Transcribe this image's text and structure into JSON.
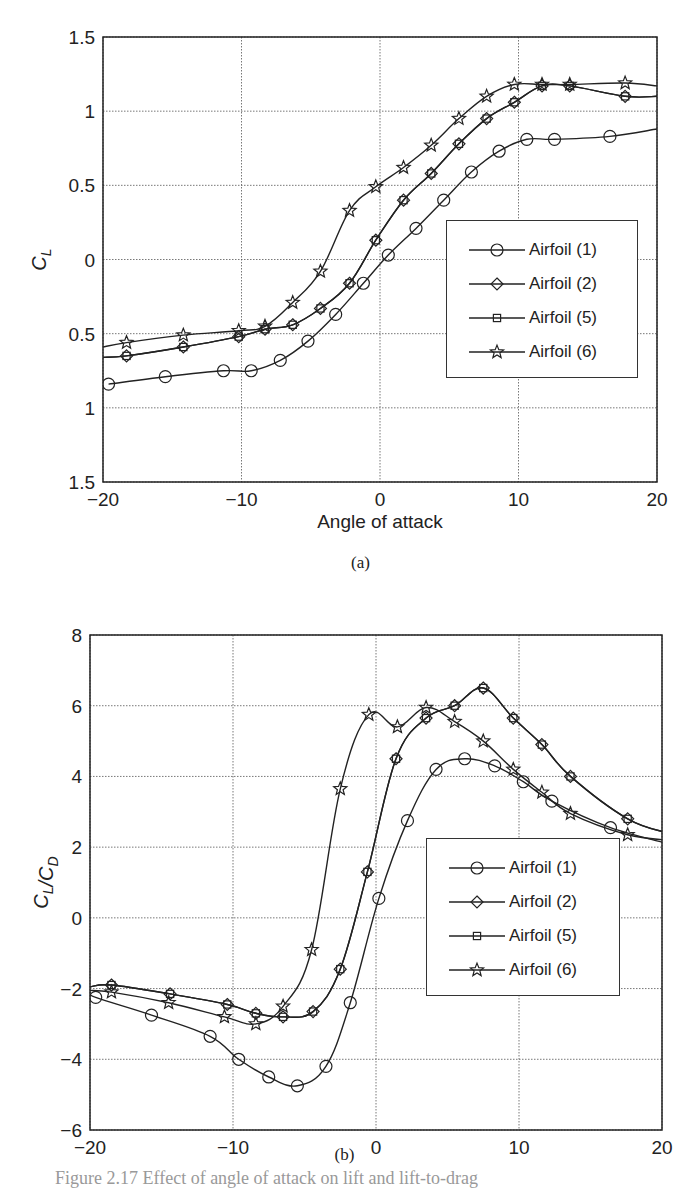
{
  "figure": {
    "panel_a_caption": "(a)",
    "panel_b_caption": "(b)",
    "figure_caption_partial": "Figure 2.17  Effect of angle of attack on lift and lift-to-drag"
  },
  "chart_data": [
    {
      "id": "a",
      "type": "line",
      "title": "",
      "xlabel": "Angle of attack",
      "ylabel": "C_L",
      "xlim": [
        -20,
        20
      ],
      "ylim": [
        -1.5,
        1.5
      ],
      "xticks": [
        "-20",
        "-10",
        "0",
        "10",
        "20"
      ],
      "yticks": [
        "1.5",
        "1",
        "0.5",
        "0",
        "0.5",
        "1",
        "1.5"
      ],
      "ytick_values": [
        1.5,
        1,
        0.5,
        0,
        -0.5,
        -1,
        -1.5
      ],
      "grid": true,
      "legend_position": "center-right",
      "series": [
        {
          "name": "Airfoil (1)",
          "marker": "circle",
          "x": [
            -19.6,
            -15.5,
            -11.3,
            -9.3,
            -7.2,
            -5.2,
            -3.2,
            -1.2,
            0.6,
            2.6,
            4.6,
            6.6,
            8.6,
            10.6,
            12.6,
            16.6,
            20
          ],
          "y": [
            -0.84,
            -0.79,
            -0.75,
            -0.75,
            -0.68,
            -0.55,
            -0.37,
            -0.16,
            0.03,
            0.21,
            0.4,
            0.59,
            0.73,
            0.81,
            0.81,
            0.83,
            0.88
          ]
        },
        {
          "name": "Airfoil (2)",
          "marker": "diamond",
          "x": [
            -20,
            -18.3,
            -14.2,
            -10.2,
            -8.3,
            -6.3,
            -4.3,
            -2.2,
            -0.3,
            1.7,
            3.7,
            5.7,
            7.7,
            9.7,
            11.7,
            13.7,
            17.7,
            20
          ],
          "y": [
            -0.66,
            -0.65,
            -0.59,
            -0.52,
            -0.47,
            -0.44,
            -0.33,
            -0.16,
            0.13,
            0.4,
            0.58,
            0.78,
            0.95,
            1.06,
            1.17,
            1.17,
            1.1,
            1.1
          ]
        },
        {
          "name": "Airfoil (5)",
          "marker": "square",
          "x": [
            -20,
            -18.3,
            -14.2,
            -10.2,
            -8.3,
            -6.3,
            -4.3,
            -2.2,
            -0.3,
            1.7,
            3.7,
            5.7,
            7.7,
            9.7,
            11.7,
            13.7,
            17.7,
            20
          ],
          "y": [
            -0.66,
            -0.65,
            -0.59,
            -0.52,
            -0.47,
            -0.44,
            -0.33,
            -0.16,
            0.13,
            0.4,
            0.58,
            0.78,
            0.95,
            1.06,
            1.17,
            1.17,
            1.1,
            1.1
          ]
        },
        {
          "name": "Airfoil (6)",
          "marker": "star",
          "x": [
            -20,
            -18.3,
            -14.2,
            -10.2,
            -8.3,
            -6.3,
            -4.3,
            -2.2,
            -0.3,
            1.7,
            3.7,
            5.7,
            7.7,
            9.7,
            11.7,
            13.7,
            17.7,
            20
          ],
          "y": [
            -0.59,
            -0.56,
            -0.51,
            -0.48,
            -0.45,
            -0.29,
            -0.08,
            0.33,
            0.49,
            0.62,
            0.77,
            0.95,
            1.1,
            1.18,
            1.18,
            1.18,
            1.19,
            1.17
          ]
        }
      ]
    },
    {
      "id": "b",
      "type": "line",
      "title": "",
      "xlabel": "Angle of attack",
      "ylabel": "C_L/C_D",
      "xlim": [
        -20,
        20
      ],
      "ylim": [
        -6,
        8
      ],
      "xticks": [
        "-20",
        "-10",
        "0",
        "10",
        "20"
      ],
      "yticks": [
        "8",
        "6",
        "4",
        "2",
        "0",
        "-2",
        "-4",
        "-6"
      ],
      "ytick_values": [
        8,
        6,
        4,
        2,
        0,
        -2,
        -4,
        -6
      ],
      "grid": true,
      "legend_position": "lower-right",
      "series": [
        {
          "name": "Airfoil (1)",
          "marker": "circle",
          "x": [
            -20,
            -19.6,
            -15.7,
            -11.6,
            -9.6,
            -7.5,
            -5.5,
            -3.5,
            -1.8,
            0.2,
            2.2,
            4.2,
            6.2,
            8.3,
            10.3,
            12.3,
            16.4,
            20.4
          ],
          "y": [
            -2.1,
            -2.25,
            -2.75,
            -3.35,
            -4.0,
            -4.5,
            -4.75,
            -4.2,
            -2.4,
            0.55,
            2.75,
            4.2,
            4.5,
            4.3,
            3.85,
            3.3,
            2.55,
            2.1
          ]
        },
        {
          "name": "Airfoil (2)",
          "marker": "diamond",
          "x": [
            -20,
            -18.5,
            -14.4,
            -10.4,
            -8.4,
            -6.5,
            -4.4,
            -2.5,
            -0.6,
            1.4,
            3.5,
            5.5,
            7.5,
            9.6,
            11.6,
            13.6,
            17.6,
            20.4
          ],
          "y": [
            -1.95,
            -1.9,
            -2.15,
            -2.45,
            -2.7,
            -2.8,
            -2.65,
            -1.45,
            1.3,
            4.5,
            5.65,
            6.0,
            6.5,
            5.65,
            4.9,
            4.0,
            2.8,
            2.4
          ]
        },
        {
          "name": "Airfoil (5)",
          "marker": "square",
          "x": [
            -20,
            -18.5,
            -14.4,
            -10.4,
            -8.4,
            -6.5,
            -4.4,
            -2.5,
            -0.6,
            1.4,
            3.5,
            5.5,
            7.5,
            9.6,
            11.6,
            13.6,
            17.6,
            20.4
          ],
          "y": [
            -1.95,
            -1.9,
            -2.15,
            -2.45,
            -2.7,
            -2.8,
            -2.65,
            -1.45,
            1.3,
            4.5,
            5.65,
            6.0,
            6.5,
            5.65,
            4.9,
            4.0,
            2.8,
            2.4
          ]
        },
        {
          "name": "Airfoil (6)",
          "marker": "star",
          "x": [
            -20,
            -18.5,
            -14.5,
            -10.6,
            -8.4,
            -6.5,
            -4.5,
            -2.5,
            -0.5,
            1.5,
            3.5,
            5.5,
            7.5,
            9.6,
            11.6,
            13.6,
            17.6,
            20.4
          ],
          "y": [
            -2.05,
            -2.1,
            -2.4,
            -2.8,
            -3.0,
            -2.5,
            -0.9,
            3.65,
            5.75,
            5.4,
            5.95,
            5.55,
            5.0,
            4.2,
            3.55,
            2.95,
            2.35,
            2.2
          ]
        }
      ]
    }
  ]
}
